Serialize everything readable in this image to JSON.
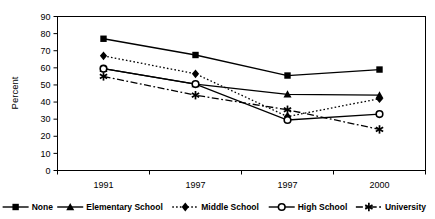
{
  "chart_data": {
    "type": "line",
    "title": "",
    "xlabel": "",
    "ylabel": "Percent",
    "categories": [
      "1991",
      "1997",
      "1997",
      "2000"
    ],
    "ylim": [
      0,
      90
    ],
    "ytick_step": 10,
    "yticks": [
      "0",
      "10",
      "20",
      "30",
      "40",
      "50",
      "60",
      "70",
      "80",
      "90"
    ],
    "grid": false,
    "legend_position": "bottom",
    "series": [
      {
        "name": "None",
        "marker": "filled-square",
        "line_style": "solid",
        "color": "#000000",
        "values": [
          77,
          67.5,
          55.5,
          59
        ]
      },
      {
        "name": "Elementary School",
        "marker": "filled-triangle",
        "line_style": "solid",
        "color": "#000000",
        "values": [
          59.5,
          50.5,
          44.5,
          44
        ]
      },
      {
        "name": "Middle School",
        "marker": "filled-diamond",
        "line_style": "dotted",
        "color": "#000000",
        "values": [
          67,
          56.5,
          31.5,
          42
        ]
      },
      {
        "name": "High School",
        "marker": "open-circle",
        "line_style": "solid",
        "color": "#000000",
        "values": [
          59.5,
          50.5,
          29.5,
          33
        ]
      },
      {
        "name": "University",
        "marker": "asterisk",
        "line_style": "dash-dot",
        "color": "#000000",
        "values": [
          55,
          44,
          35.5,
          24
        ]
      }
    ]
  },
  "legend": {
    "items": [
      {
        "label": "None",
        "marker": "filled-square-icon"
      },
      {
        "label": "Elementary School",
        "marker": "filled-triangle-icon"
      },
      {
        "label": "Middle School",
        "marker": "filled-diamond-icon"
      },
      {
        "label": "High School",
        "marker": "open-circle-icon"
      },
      {
        "label": "University",
        "marker": "asterisk-icon"
      }
    ]
  },
  "axes": {
    "y_title": "Percent"
  }
}
